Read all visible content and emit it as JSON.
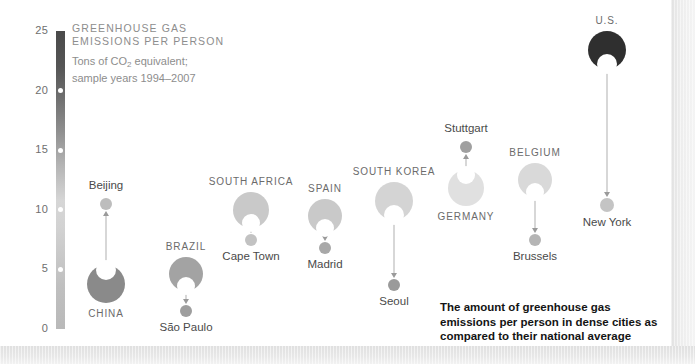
{
  "header": {
    "title_line1": "GREENHOUSE GAS",
    "title_line2": "EMISSIONS PER PERSON",
    "subtitle_pre": "Tons of CO",
    "subtitle_sub": "2",
    "subtitle_post": " equivalent;",
    "subtitle_line2": "sample years 1994–2007"
  },
  "caption": {
    "line1": "The amount of greenhouse gas",
    "line2": "emissions per person in dense cities as",
    "line3": "compared to their national average"
  },
  "axis": {
    "ticks": [
      "25",
      "20",
      "15",
      "10",
      "5",
      "0"
    ],
    "tick_values": [
      25,
      20,
      15,
      10,
      5,
      0
    ],
    "dot_values": [
      20,
      15,
      10,
      5
    ]
  },
  "colors": {
    "axis_dark": "#4a4a4a",
    "axis_light": "#d6d6d6",
    "connector": "#b0b0b0",
    "label_country": "#6b6b6b",
    "label_city": "#4a4a4a",
    "title_gray": "#8d8d8d",
    "caption_black": "#141414",
    "background": "#ffffff",
    "frame_band": "#e6e6e6"
  },
  "chart_data": {
    "type": "scatter",
    "title": "GREENHOUSE GAS EMISSIONS PER PERSON",
    "subtitle": "Tons of CO2 equivalent; sample years 1994–2007",
    "ylabel": "Tons of CO2 equivalent per person",
    "xlabel": "",
    "ylim": [
      0,
      25
    ],
    "yticks": [
      0,
      5,
      10,
      15,
      20,
      25
    ],
    "grid": false,
    "legend": "none",
    "annotation": "The amount of greenhouse gas emissions per person in dense cities as compared to their national average",
    "pairs": [
      {
        "country_label": "CHINA",
        "country_value": 3.8,
        "country_color": "#8a8a8a",
        "country_radius": 19,
        "city_label": "Beijing",
        "city_value": 10.5,
        "city_color": "#bdbdbd",
        "city_radius": 6,
        "direction": "up",
        "x": 106
      },
      {
        "country_label": "BRAZIL",
        "country_value": 4.6,
        "country_color": "#a3a3a3",
        "country_radius": 17,
        "city_label": "São Paulo",
        "city_value": 1.5,
        "city_color": "#9e9e9e",
        "city_radius": 6,
        "direction": "down",
        "x": 186
      },
      {
        "country_label": "SOUTH AFRICA",
        "country_value": 10.0,
        "country_color": "#c9c9c9",
        "country_radius": 18,
        "city_label": "Cape Town",
        "city_value": 7.5,
        "city_color": "#c2c2c2",
        "city_radius": 6,
        "direction": "down",
        "x": 251
      },
      {
        "country_label": "SPAIN",
        "country_value": 9.5,
        "country_color": "#c9c9c9",
        "country_radius": 17,
        "city_label": "Madrid",
        "city_value": 6.8,
        "city_color": "#a8a8a8",
        "city_radius": 6,
        "direction": "down",
        "x": 325
      },
      {
        "country_label": "SOUTH KOREA",
        "country_value": 10.7,
        "country_color": "#d4d4d4",
        "country_radius": 19,
        "city_label": "Seoul",
        "city_value": 3.7,
        "city_color": "#9a9a9a",
        "city_radius": 6,
        "direction": "down",
        "x": 394
      },
      {
        "country_label": "GERMANY",
        "country_value": 11.8,
        "country_color": "#e0e0e0",
        "country_radius": 18,
        "city_label": "Stuttgart",
        "city_value": 15.3,
        "city_color": "#a0a0a0",
        "city_radius": 6,
        "direction": "up",
        "x": 466
      },
      {
        "country_label": "BELGIUM",
        "country_value": 12.5,
        "country_color": "#d9d9d9",
        "country_radius": 17,
        "city_label": "Brussels",
        "city_value": 7.5,
        "city_color": "#b5b5b5",
        "city_radius": 6,
        "direction": "down",
        "x": 535
      },
      {
        "country_label": "U.S.",
        "country_value": 23.4,
        "country_color": "#2f2f2f",
        "country_radius": 19,
        "city_label": "New York",
        "city_value": 10.4,
        "city_color": "#c4c4c4",
        "city_radius": 7,
        "direction": "down",
        "x": 607
      }
    ]
  }
}
